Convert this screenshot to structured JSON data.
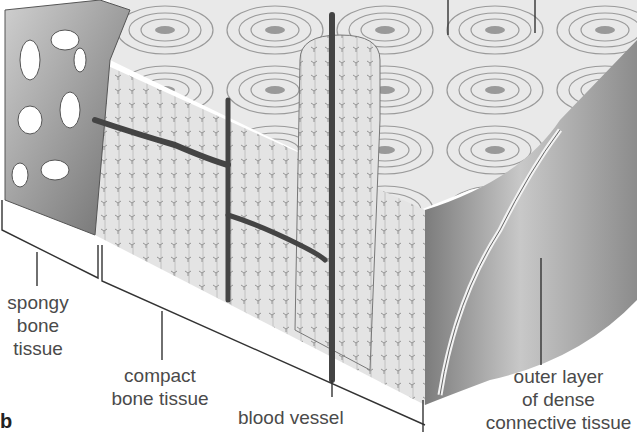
{
  "figure": {
    "panel_label": "b",
    "labels": {
      "spongy": [
        "spongy",
        "bone",
        "tissue"
      ],
      "compact": [
        "compact",
        "bone tissue"
      ],
      "vessel": [
        "blood vessel"
      ],
      "outer": [
        "outer layer",
        "of dense",
        "connective tissue"
      ]
    }
  }
}
